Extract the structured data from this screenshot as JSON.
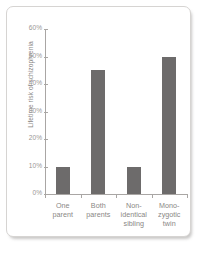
{
  "chart_data": {
    "type": "bar",
    "title": "",
    "subtitle": "",
    "xlabel": "",
    "ylabel": "Lifetime risk of schizophrenia",
    "categories": [
      "One\nparent",
      "Both\nparents",
      "Non-\nidentical\nsibling",
      "Mono-\nzygotic\ntwin"
    ],
    "values": [
      10,
      45,
      10,
      50
    ],
    "ylim": [
      0,
      60
    ],
    "ytick_values": [
      0,
      10,
      20,
      30,
      40,
      50,
      60
    ],
    "ytick_labels": [
      "0%",
      "10%",
      "20%",
      "30%",
      "40%",
      "50%",
      "60%"
    ],
    "grid": false,
    "legend": null,
    "bar_color": "#6d6b6b",
    "axis_color": "#a9a6a4",
    "text_color": "#8a8785",
    "background_color": "#ffffff"
  }
}
